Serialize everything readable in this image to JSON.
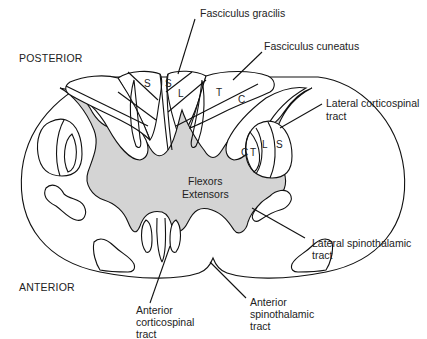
{
  "diagram": {
    "colors": {
      "gray_matter": "#d4d4d4",
      "white_matter": "#ffffff",
      "outline": "#111111"
    },
    "orientation": {
      "top": "POSTERIOR",
      "bottom": "ANTERIOR"
    },
    "labels": {
      "fasciculus_gracilis": "Fasciculus gracilis",
      "fasciculus_cuneatus": "Fasciculus cuneatus",
      "lateral_corticospinal": [
        "Lateral corticospinal",
        "tract"
      ],
      "lateral_spinothalamic": [
        "Lateral spinothalamic",
        "tract"
      ],
      "anterior_spinothalamic": [
        "Anterior",
        "spinothalamic",
        "tract"
      ],
      "anterior_corticospinal": [
        "Anterior",
        "corticospinal",
        "tract"
      ],
      "gray_matter": [
        "Flexors",
        "Extensors"
      ]
    },
    "somatotopy": {
      "gracilis_left": [
        "S"
      ],
      "gracilis_right": [
        "S",
        "L"
      ],
      "cuneatus_right": [
        "T",
        "C"
      ],
      "lateral_corticospinal_right": [
        "C",
        "T",
        "L",
        "S"
      ]
    }
  }
}
